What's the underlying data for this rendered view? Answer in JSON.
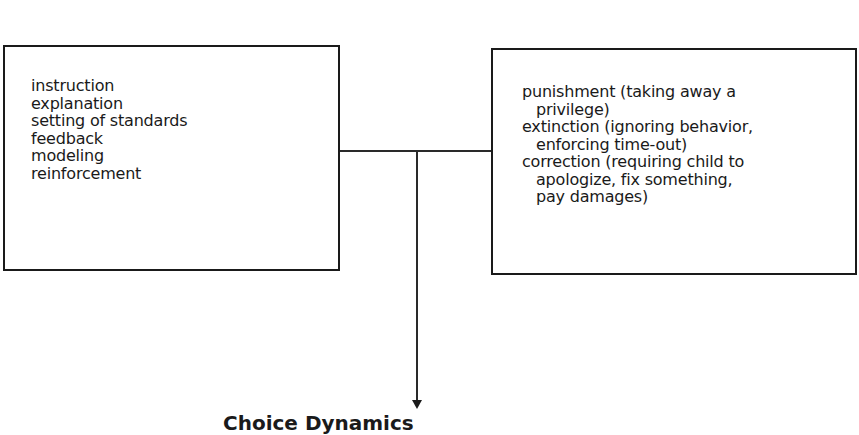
{
  "diagram": {
    "left_box": {
      "items": [
        "instruction",
        "explanation",
        "setting of standards",
        "feedback",
        "modeling",
        "reinforcement"
      ]
    },
    "right_box": {
      "items": [
        {
          "main": "punishment (taking away a",
          "cont": "privilege)"
        },
        {
          "main": "extinction (ignoring behavior,",
          "cont": "enforcing time-out)"
        },
        {
          "main": "correction (requiring child to",
          "cont": "apologize, fix something,"
        },
        {
          "main": "",
          "cont": "pay damages)"
        }
      ]
    },
    "result_label": "Choice Dynamics",
    "colors": {
      "line": "#1a1a1a",
      "background": "#ffffff"
    }
  }
}
